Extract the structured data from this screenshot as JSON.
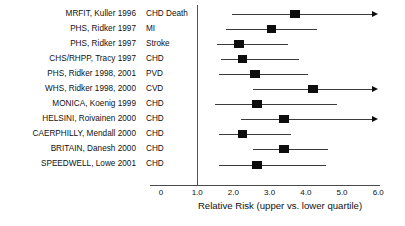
{
  "chart_data": {
    "type": "forest",
    "title": "",
    "xlabel": "Relative Risk (upper vs. lower quartile)",
    "ylabel": "",
    "xlim": [
      0,
      6.0
    ],
    "xticks": [
      "0",
      "1.0",
      "2.0",
      "3.0",
      "4.0",
      "5.0",
      "6.0"
    ],
    "xtick_values": [
      0,
      1.0,
      2.0,
      3.0,
      4.0,
      5.0,
      6.0
    ],
    "reference_line": 1.0,
    "grid": false,
    "legend": "none",
    "columns": [
      "Study",
      "Endpoint",
      "Relative Risk"
    ],
    "rows": [
      {
        "study": "MRFIT, Kuller 1996",
        "outcome": "CHD Death",
        "estimate": 3.7,
        "ci_low": 1.95,
        "ci_high": 6.0,
        "truncated_right": true
      },
      {
        "study": "PHS, Ridker 1997",
        "outcome": "MI",
        "estimate": 3.05,
        "ci_low": 1.8,
        "ci_high": 4.3,
        "truncated_right": false
      },
      {
        "study": "PHS, Ridker 1997",
        "outcome": "Stroke",
        "estimate": 2.15,
        "ci_low": 1.55,
        "ci_high": 3.5,
        "truncated_right": false
      },
      {
        "study": "CHS/RHPP, Tracy 1997",
        "outcome": "CHD",
        "estimate": 2.25,
        "ci_low": 1.65,
        "ci_high": 3.8,
        "truncated_right": false
      },
      {
        "study": "PHS, Ridker 1998, 2001",
        "outcome": "PVD",
        "estimate": 2.6,
        "ci_low": 1.6,
        "ci_high": 4.05,
        "truncated_right": false
      },
      {
        "study": "WHS, Ridker 1998, 2000",
        "outcome": "CVD",
        "estimate": 4.2,
        "ci_low": 2.55,
        "ci_high": 6.0,
        "truncated_right": true
      },
      {
        "study": "MONICA, Koenig 1999",
        "outcome": "CHD",
        "estimate": 2.65,
        "ci_low": 1.5,
        "ci_high": 4.85,
        "truncated_right": false
      },
      {
        "study": "HELSINI, Roivainen 2000",
        "outcome": "CHD",
        "estimate": 3.4,
        "ci_low": 2.2,
        "ci_high": 6.0,
        "truncated_right": true
      },
      {
        "study": "CAERPHILLY, Mendall 2000",
        "outcome": "CHD",
        "estimate": 2.25,
        "ci_low": 1.6,
        "ci_high": 3.6,
        "truncated_right": false
      },
      {
        "study": "BRITAIN, Danesh 2000",
        "outcome": "CHD",
        "estimate": 3.4,
        "ci_low": 2.55,
        "ci_high": 4.6,
        "truncated_right": false
      },
      {
        "study": "SPEEDWELL, Lowe 2001",
        "outcome": "CHD",
        "estimate": 2.65,
        "ci_low": 1.6,
        "ci_high": 4.55,
        "truncated_right": false
      }
    ]
  },
  "style": {
    "marker_color": "#0d0d0d",
    "line_color": "#3b3b3b",
    "axis_color": "#4a4a4a",
    "text_color": "#111111",
    "background": "#ffffff"
  }
}
